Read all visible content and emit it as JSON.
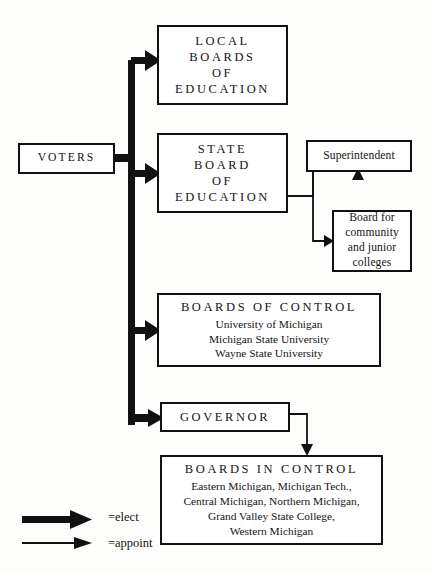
{
  "diagram": {
    "nodes": {
      "voters": {
        "label": "VOTERS"
      },
      "local_boards": {
        "line1": "LOCAL",
        "line2": "BOARDS",
        "line3": "OF",
        "line4": "EDUCATION"
      },
      "state_board": {
        "line1": "STATE",
        "line2": "BOARD",
        "line3": "OF",
        "line4": "EDUCATION"
      },
      "superintendent": {
        "label": "Superintendent"
      },
      "community_colleges": {
        "line1": "Board for",
        "line2": "community",
        "line3": "and junior",
        "line4": "colleges"
      },
      "boards_of_control": {
        "heading": "BOARDS OF CONTROL",
        "items": [
          "University of Michigan",
          "Michigan State University",
          "Wayne State University"
        ]
      },
      "governor": {
        "label": "GOVERNOR"
      },
      "boards_in_control": {
        "heading": "BOARDS IN CONTROL",
        "items": [
          "Eastern Michigan, Michigan Tech.,",
          "Central Michigan, Northern Michigan,",
          "Grand Valley State College,",
          "Western Michigan"
        ]
      }
    },
    "legend": {
      "elect": {
        "icon": "thick-arrow-icon",
        "label": "=elect"
      },
      "appoint": {
        "icon": "thin-arrow-icon",
        "label": "=appoint"
      }
    },
    "colors": {
      "ink": "#111111",
      "paper": "#fdfdfb"
    }
  }
}
